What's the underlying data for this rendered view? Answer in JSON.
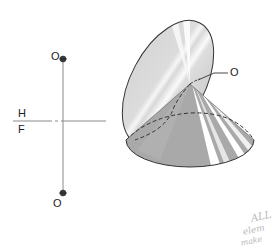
{
  "figure": {
    "type": "descriptive-geometry",
    "colors": {
      "line": "#333333",
      "upper_cone_fill": "#d9d9d9",
      "upper_cone_highlight": "#f4f4f4",
      "lower_cone_fill": "#a8a8a8",
      "lower_cone_highlight": "#ffffff",
      "handwriting": "#b8b8b8"
    }
  },
  "projection": {
    "top_point_label": "O",
    "bottom_point_label": "O",
    "reference_line_upper_label": "H",
    "reference_line_lower_label": "F"
  },
  "pictorial": {
    "vertex_label": "O"
  },
  "annotation": {
    "handwritten_lines": [
      "ALL",
      "elem",
      "make"
    ]
  }
}
